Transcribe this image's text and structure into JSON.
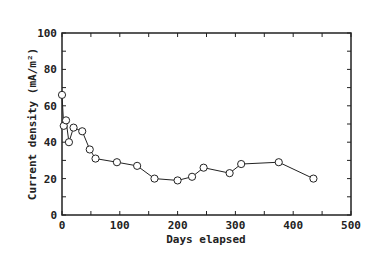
{
  "chart_data": {
    "type": "line",
    "title": "",
    "xlabel": "Days elapsed",
    "ylabel": "Current density (mA/m²)",
    "xlim": [
      0,
      500
    ],
    "ylim": [
      0,
      100
    ],
    "x_ticks": [
      0,
      100,
      200,
      300,
      400,
      500
    ],
    "y_ticks": [
      0,
      20,
      40,
      60,
      80,
      100
    ],
    "grid": false,
    "legend": null,
    "marker": "open-circle",
    "series": [
      {
        "name": "Current density",
        "x": [
          0,
          3,
          7,
          12,
          20,
          35,
          48,
          58,
          95,
          130,
          160,
          200,
          225,
          245,
          290,
          310,
          375,
          435
        ],
        "y": [
          66,
          49,
          52,
          40,
          48,
          46,
          36,
          31,
          29,
          27,
          20,
          19,
          21,
          26,
          23,
          28,
          29,
          20
        ]
      }
    ]
  }
}
